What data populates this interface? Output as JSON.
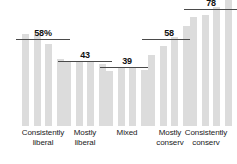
{
  "chart_data": {
    "type": "bar",
    "title": "",
    "subtitle": "",
    "xlabel": "",
    "ylabel": "",
    "ylim": [
      0,
      100
    ],
    "grid": false,
    "legend": false,
    "categories": [
      "Consistently liberal",
      "Mostly liberal",
      "Mixed",
      "Mostly conserv",
      "Consistently conserv"
    ],
    "groups": [
      {
        "label_line1": "Consistently",
        "label_line2": "liberal",
        "value_label": "58%",
        "reference_value": 58,
        "bars": [
          62,
          61,
          55,
          45
        ]
      },
      {
        "label_line1": "Mostly",
        "label_line2": "liberal",
        "value_label": "43",
        "reference_value": 43,
        "bars": [
          44,
          44,
          44,
          42
        ]
      },
      {
        "label_line1": "Mixed",
        "label_line2": "",
        "value_label": "39",
        "reference_value": 39,
        "bars": [
          37,
          40,
          40,
          38
        ]
      },
      {
        "label_line1": "Mostly",
        "label_line2": "conserv",
        "value_label": "58",
        "reference_value": 58,
        "bars": [
          48,
          54,
          60,
          67
        ]
      },
      {
        "label_line1": "Consistently",
        "label_line2": "conserv",
        "value_label": "78",
        "reference_value": 78,
        "bars": [
          73,
          75,
          80,
          88
        ]
      }
    ],
    "colors": {
      "bar": "#dcdcdc",
      "reference_line": "#4a4a4a",
      "value_label": "#111111",
      "category_label": "#1a1a1a",
      "background": "#ffffff"
    }
  }
}
